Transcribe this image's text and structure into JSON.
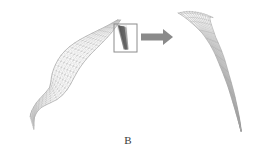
{
  "figure": {
    "panel_label": "B",
    "background_color": "#ffffff",
    "type": "scientific-schematic"
  },
  "colors": {
    "mesh_line": "#9a9a9a",
    "mesh_line_light": "#b9b9b9",
    "mesh_edge": "#7d7d7d",
    "dark_wedge": "#3c3c3c",
    "box_stroke": "#8c8c8c",
    "arrow_fill": "#8a8a8a",
    "detail_line": "#8f8f8f",
    "detail_line_dark": "#6e6e6e",
    "label_text": "#3a3a3a"
  },
  "left_panel": {
    "name": "wireframe-ribbon-surface",
    "grid_u_count": 26,
    "grid_v_count": 7,
    "line_width": 0.35,
    "centerline": [
      [
        119.0,
        20.0
      ],
      [
        112.5,
        25.5
      ],
      [
        105.5,
        31.0
      ],
      [
        98.0,
        36.5
      ],
      [
        90.5,
        42.0
      ],
      [
        83.5,
        47.5
      ],
      [
        77.0,
        53.5
      ],
      [
        71.5,
        60.0
      ],
      [
        67.0,
        67.0
      ],
      [
        63.5,
        74.0
      ],
      [
        60.5,
        81.0
      ],
      [
        57.0,
        87.5
      ],
      [
        52.5,
        93.0
      ],
      [
        47.0,
        97.5
      ],
      [
        41.5,
        102.0
      ],
      [
        37.0,
        107.0
      ],
      [
        34.0,
        112.5
      ],
      [
        32.5,
        118.0
      ],
      [
        32.0,
        123.0
      ]
    ],
    "halfwidths": [
      1.5,
      4.0,
      6.5,
      8.5,
      10.0,
      11.0,
      11.6,
      11.8,
      11.6,
      11.2,
      10.6,
      9.8,
      8.8,
      7.6,
      6.6,
      6.0,
      5.8,
      6.2,
      7.0
    ],
    "normal_angles_deg": [
      -46,
      -44,
      -41,
      -38,
      -34,
      -29,
      -22,
      -14,
      -6,
      2,
      10,
      19,
      29,
      40,
      50,
      58,
      64,
      68,
      70
    ]
  },
  "inset_box": {
    "name": "detail-region-box",
    "x": 114,
    "y": 24,
    "width": 23,
    "height": 28,
    "stroke_width": 1.0
  },
  "arrow": {
    "name": "magnify-arrow",
    "direction": "right",
    "x_start": 141,
    "x_end": 173,
    "y_center": 37,
    "shaft_height": 7,
    "head_length": 10,
    "head_height": 16
  },
  "right_panel": {
    "name": "magnified-detail-fan",
    "description": "Converging curved wireframe lines narrowing from upper-left to lower-right tip",
    "fan_line_count": 13,
    "cross_line_count": 16,
    "line_width": 0.4,
    "outer_curve": [
      [
        178.0,
        13.0
      ],
      [
        188.0,
        19.0
      ],
      [
        197.0,
        27.0
      ],
      [
        205.0,
        37.0
      ],
      [
        213.0,
        50.0
      ],
      [
        220.0,
        66.0
      ],
      [
        227.0,
        84.0
      ],
      [
        233.0,
        103.0
      ],
      [
        238.0,
        120.0
      ],
      [
        241.0,
        131.0
      ]
    ],
    "inner_curve": [
      [
        196.0,
        12.0
      ],
      [
        205.0,
        20.0
      ],
      [
        212.0,
        30.0
      ],
      [
        218.0,
        42.0
      ],
      [
        224.0,
        57.0
      ],
      [
        229.0,
        74.0
      ],
      [
        234.0,
        92.0
      ],
      [
        238.0,
        110.0
      ],
      [
        240.5,
        124.0
      ],
      [
        241.0,
        131.0
      ]
    ],
    "top_spread": [
      [
        178.0,
        13.0
      ],
      [
        185.0,
        11.5
      ],
      [
        192.0,
        11.5
      ],
      [
        199.0,
        12.5
      ],
      [
        206.0,
        14.5
      ],
      [
        213.0,
        17.5
      ]
    ]
  }
}
